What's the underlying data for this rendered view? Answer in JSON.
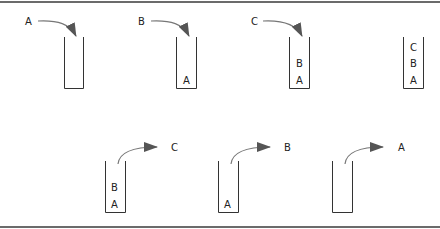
{
  "diagram": {
    "title": "",
    "colors": {
      "frame": "#6b6b6b",
      "stack_outline": "#333333",
      "arrow_line": "#777777",
      "arrow_head": "#555555",
      "text": "#222222"
    },
    "push_row": {
      "stacks": [
        {
          "incoming": "A",
          "contents": []
        },
        {
          "incoming": "B",
          "contents": [
            "A"
          ]
        },
        {
          "incoming": "C",
          "contents": [
            "A",
            "B"
          ]
        },
        {
          "incoming": null,
          "contents": [
            "A",
            "B",
            "C"
          ]
        }
      ]
    },
    "pop_row": {
      "stacks": [
        {
          "outgoing": "C",
          "contents": [
            "A",
            "B"
          ]
        },
        {
          "outgoing": "B",
          "contents": [
            "A"
          ]
        },
        {
          "outgoing": "A",
          "contents": []
        }
      ]
    },
    "labels": {
      "push1_in": "A",
      "push2_in": "B",
      "push2_c0": "A",
      "push3_in": "C",
      "push3_c0": "A",
      "push3_c1": "B",
      "push4_c0": "A",
      "push4_c1": "B",
      "push4_c2": "C",
      "pop1_out": "C",
      "pop1_c0": "A",
      "pop1_c1": "B",
      "pop2_out": "B",
      "pop2_c0": "A",
      "pop3_out": "A"
    }
  }
}
